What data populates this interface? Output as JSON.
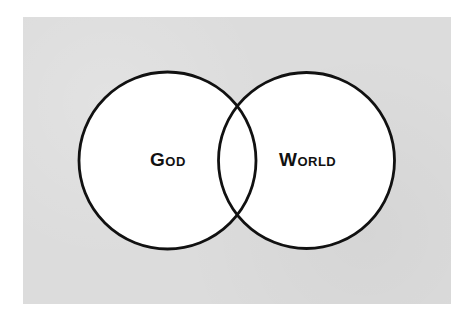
{
  "diagram": {
    "type": "venn",
    "background_color": "#dcdcdc",
    "stroke_color": "#111111",
    "fill_color": "#ffffff",
    "sets": [
      {
        "id": "god",
        "label": "God"
      },
      {
        "id": "world",
        "label": "World"
      }
    ]
  }
}
